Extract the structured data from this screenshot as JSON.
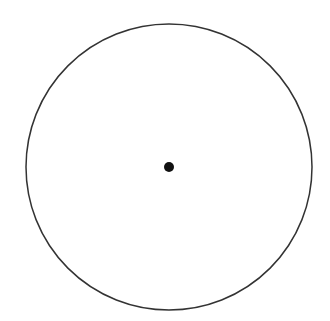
{
  "diagram": {
    "type": "circle-with-center-point",
    "background": "#ffffff",
    "circle": {
      "cx": 169,
      "cy": 167,
      "r": 143,
      "stroke": "#333333",
      "stroke_width": 1.5,
      "fill": "none"
    },
    "center_point": {
      "cx": 169,
      "cy": 167,
      "r": 5,
      "fill": "#111111"
    }
  }
}
